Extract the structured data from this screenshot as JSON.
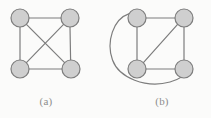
{
  "figure": {
    "background_color": "#fbfbfa",
    "width": 211,
    "height": 118,
    "node_fill_color": "#cfcfcf",
    "node_stroke_color": "#7d7d7d",
    "edge_color": "#7d7d7d",
    "caption_color": "#8d8d8d",
    "node_radius": 9,
    "edge_width": 1.2,
    "node_stroke_width": 1.2
  },
  "panels": [
    {
      "id": "a",
      "caption": "(a)",
      "graph_type": "complete-graph-k4",
      "nodes": [
        {
          "id": "a-top-left",
          "label": "",
          "cx": 20,
          "cy": 18,
          "r": 9
        },
        {
          "id": "a-top-right",
          "label": "",
          "cx": 70,
          "cy": 18,
          "r": 9
        },
        {
          "id": "a-bottom-left",
          "label": "",
          "cx": 20,
          "cy": 69,
          "r": 9
        },
        {
          "id": "a-bottom-right",
          "label": "",
          "cx": 71,
          "cy": 69,
          "r": 9
        }
      ],
      "edges": [
        {
          "id": "a-edge-top",
          "from": "a-top-left",
          "to": "a-top-right",
          "kind": "straight"
        },
        {
          "id": "a-edge-left",
          "from": "a-top-left",
          "to": "a-bottom-left",
          "kind": "straight"
        },
        {
          "id": "a-edge-right",
          "from": "a-top-right",
          "to": "a-bottom-right",
          "kind": "straight"
        },
        {
          "id": "a-edge-bottom",
          "from": "a-bottom-left",
          "to": "a-bottom-right",
          "kind": "straight"
        },
        {
          "id": "a-edge-diagonal-nw-se",
          "from": "a-top-left",
          "to": "a-bottom-right",
          "kind": "straight"
        },
        {
          "id": "a-edge-diagonal-ne-sw",
          "from": "a-top-right",
          "to": "a-bottom-left",
          "kind": "straight"
        }
      ],
      "edge_count": 6
    },
    {
      "id": "b",
      "caption": "(b)",
      "graph_type": "square-with-diagonal-and-arc",
      "nodes": [
        {
          "id": "b-top-left",
          "label": "",
          "cx": 137,
          "cy": 18,
          "r": 9
        },
        {
          "id": "b-top-right",
          "label": "",
          "cx": 184,
          "cy": 18,
          "r": 9
        },
        {
          "id": "b-bottom-left",
          "label": "",
          "cx": 137,
          "cy": 69,
          "r": 9
        },
        {
          "id": "b-bottom-right",
          "label": "",
          "cx": 184,
          "cy": 69,
          "r": 9
        }
      ],
      "edges": [
        {
          "id": "b-edge-top",
          "from": "b-top-left",
          "to": "b-top-right",
          "kind": "straight"
        },
        {
          "id": "b-edge-left",
          "from": "b-top-left",
          "to": "b-bottom-left",
          "kind": "straight"
        },
        {
          "id": "b-edge-right",
          "from": "b-top-right",
          "to": "b-bottom-right",
          "kind": "straight"
        },
        {
          "id": "b-edge-bottom",
          "from": "b-bottom-left",
          "to": "b-bottom-right",
          "kind": "straight"
        },
        {
          "id": "b-edge-diagonal-ne-sw",
          "from": "b-top-right",
          "to": "b-bottom-left",
          "kind": "straight"
        },
        {
          "id": "b-edge-arc",
          "from": "b-top-left",
          "to": "b-bottom-right",
          "kind": "arc-around-left-and-bottom"
        }
      ],
      "edge_count": 6
    }
  ],
  "geometry": {
    "panel_a_edges_path": "M 29 18 L 61 18 M 20 27 L 20 60 M 70 27 L 70 60 M 29 69 L 62 69 M 26.4 24.4 L 64.6 62.6 M 63.6 24.4 L 26.4 62.6",
    "panel_b_edges_path": "M 146 18 L 175 18 M 137 27 L 137 60 M 184 27 L 184 60 M 146 69 L 175 69 M 177.6 24.4 L 143.4 62.6",
    "panel_b_arc_path": "M 129.5 13.2 C 112 20 105 44 114 62 C 123 80 150 88 172 80 C 182 76 188 72 191 67"
  }
}
